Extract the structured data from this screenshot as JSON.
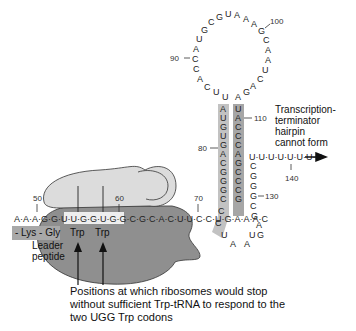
{
  "figure": {
    "loop_sequence": [
      "C",
      "A",
      "C",
      "C",
      "A",
      "U",
      "G",
      "C",
      "G",
      "U",
      "A",
      "A",
      "A",
      "G",
      "C",
      "A",
      "A",
      "U",
      "C",
      "A",
      "G",
      "A"
    ],
    "stem_left": [
      "U",
      "A",
      "U",
      "G",
      "U",
      "G",
      "A",
      "C",
      "G",
      "G",
      "G",
      "C"
    ],
    "stem_right": [
      "A",
      "U",
      "A",
      "C",
      "C",
      "C",
      "A",
      "G",
      "C",
      "C",
      "C",
      "G"
    ],
    "number_labels": {
      "n50": "50",
      "n60": "60",
      "n70": "70",
      "n80": "80",
      "n90": "90",
      "n100": "100",
      "n110": "110",
      "n130": "130",
      "n140": "140"
    },
    "leader_sequence": "A·A·A·G·G·U·U·G·G·U·G·G·C·G·C·A·C·U·U·C·C·U·G·A·A·A·C",
    "tail_sequence": "U·U·U·U·U·U·U·U",
    "descending_strand": [
      "C",
      "G",
      "G",
      "C",
      "G",
      "A",
      "G",
      "U"
    ],
    "bottom_loop": [
      "C",
      "C",
      "U",
      "A",
      "A"
    ],
    "peptide": {
      "left": "- Lys - Gly",
      "trp1": "Trp",
      "trp2": "Trp",
      "leader_label_1": "Leader",
      "leader_label_2": "peptide"
    },
    "side_label": {
      "l1": "Transcription-",
      "l2": "terminator",
      "l3": "hairpin",
      "l4": "cannot form"
    },
    "caption": {
      "l1": "Positions at which ribosomes would stop",
      "l2": "without sufficient Trp-tRNA to respond to the",
      "l3": "two UGG Trp codons"
    },
    "colors": {
      "ribosome_large": "#8f8f8f",
      "ribosome_small": "#d9d9d9",
      "stem_highlight": "#b0b0b0",
      "peptide_box": "#a8a8a8"
    }
  }
}
